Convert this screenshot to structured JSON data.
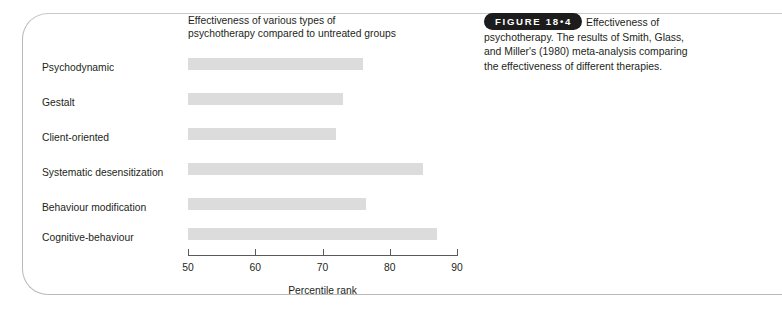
{
  "figure": {
    "badge_label": "FIGURE 18•4",
    "caption": "Effectiveness of psychotherapy. The results of Smith, Glass, and Miller's (1980) meta-analysis comparing the effectiveness of different therapies."
  },
  "chart_data": {
    "type": "bar",
    "orientation": "horizontal",
    "title": "Effectiveness of various types of\npsychotherapy compared to untreated groups",
    "xlabel": "Percentile rank",
    "ylabel": "",
    "xlim": [
      50,
      90
    ],
    "xticks": [
      50,
      60,
      70,
      80,
      90
    ],
    "xtick_labels": [
      "50",
      "60",
      "70",
      "80",
      "90"
    ],
    "grid": false,
    "legend": "none",
    "bar_color": "#dcdcdc",
    "categories": [
      "Psychodynamic",
      "Gestalt",
      "Client-oriented",
      "Systematic desensitization",
      "Behaviour modification",
      "Cognitive-behaviour"
    ],
    "values": [
      76,
      73,
      72,
      85,
      76.5,
      87
    ]
  }
}
